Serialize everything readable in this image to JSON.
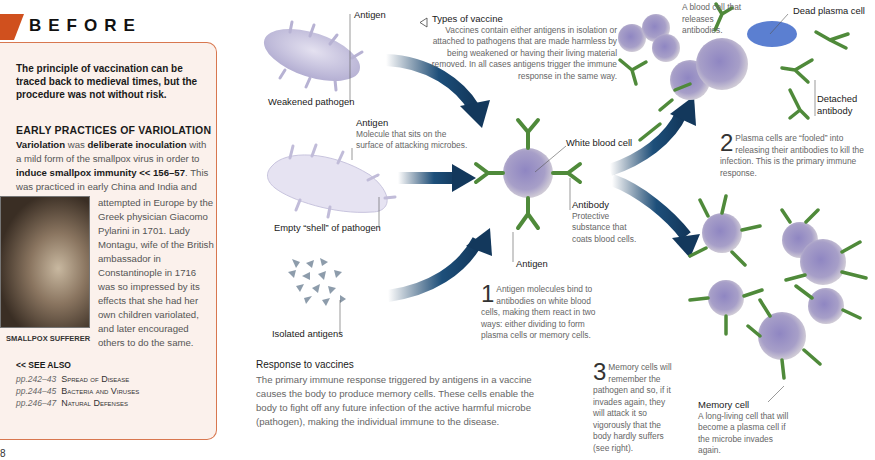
{
  "before_panel": {
    "tab_title": "BEFORE",
    "intro": "The principle of vaccination can be traced back to medieval times, but the procedure was not without risk.",
    "subheading": "EARLY PRACTICES OF VARIOLATION",
    "body_part1_bold": "Variolation",
    "body_part2": " was ",
    "body_part3_bold": "deliberate inoculation",
    "body_part4": " with a mild form of the smallpox virus in order to ",
    "body_part5_bold": "induce smallpox immunity << 156–57",
    "body_part6": ". This was practiced in early China and India and was",
    "body_wrap": "attempted in Europe by the Greek physician Giacomo Pylarini in 1701. Lady Montagu, wife of the British ambassador in Constantinople in 1716 was so impressed by its effects that she had her own children variolated, and later encouraged others to do the same.",
    "photo_caption": "SMALLPOX SUFFERER",
    "see_also_label": "<< SEE ALSO",
    "see_also": [
      {
        "pages": "pp.242–43",
        "title": "Spread of Disease"
      },
      {
        "pages": "pp.244–45",
        "title": "Bacteria and Viruses"
      },
      {
        "pages": "pp.246–47",
        "title": "Natural Defenses"
      }
    ]
  },
  "page_number": "8",
  "diagram": {
    "labels": {
      "antigen_top": "Antigen",
      "weakened_pathogen": "Weakened pathogen",
      "antigen_mid_head": "Antigen",
      "antigen_mid_desc": "Molecule that sits on the surface of attacking microbes.",
      "empty_shell": "Empty “shell” of pathogen",
      "isolated_antigens": "Isolated antigens",
      "white_blood_cell": "White blood cell",
      "antibody_head": "Antibody",
      "antibody_desc": "Protective substance that coats blood cells.",
      "antigen_bottom": "Antigen",
      "plasma_cell_desc": "A blood cell that releases antibodies.",
      "dead_plasma_cell": "Dead plasma cell",
      "detached_antibody": "Detached antibody",
      "memory_cell_head": "Memory cell",
      "memory_cell_desc": "A long-living cell that will become a plasma cell if the microbe invades again."
    },
    "types_of_vaccine": {
      "title": "Types of vaccine",
      "text": "Vaccines contain either antigens in isolation or attached to pathogens that are made harmless by being weakened or having their living material removed.  In all cases antigens trigger the immune response in the same way."
    },
    "steps": [
      {
        "num": "1",
        "text": "Antigen molecules bind to antibodies on white blood cells, making them react in two ways: either dividing to form plasma cells or memory cells."
      },
      {
        "num": "2",
        "text": "Plasma cells are “fooled” into releasing their antibodies to kill the infection. This is the primary immune response."
      },
      {
        "num": "3",
        "text": "Memory cells will remember the pathogen and so, if it invades again, they will attack it so vigorously that the body hardly suffers (see right)."
      }
    ]
  },
  "response": {
    "heading": "Response to vaccines",
    "text": "The primary immune response triggered by antigens in a vaccine causes the body to produce memory cells. These cells enable the body to fight off any future infection of the active harmful microbe (pathogen), making the individual immune to the disease."
  },
  "colors": {
    "accent_orange": "#d0501e",
    "panel_bg": "#fbf1ec",
    "arrow_navy": "#13385c",
    "antibody_green": "#4f8a3a",
    "cell_purple": "#9a90bd"
  }
}
